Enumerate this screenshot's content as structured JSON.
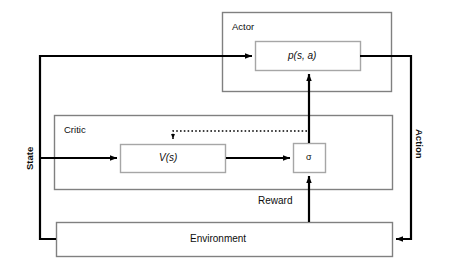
{
  "diagram": {
    "colors": {
      "outer_box_stroke": "#808080",
      "inner_box_stroke": "#a6a6a6",
      "arrow_stroke": "#000000",
      "dotted_stroke": "#000000",
      "background": "#ffffff",
      "text": "#0d0d0d"
    },
    "groups": [
      {
        "id": "actor",
        "label": "Actor"
      },
      {
        "id": "critic",
        "label": "Critic"
      }
    ],
    "nodes": [
      {
        "id": "policy",
        "label": "p(s, a)"
      },
      {
        "id": "value",
        "label": "V(s)"
      },
      {
        "id": "sigma",
        "label": "σ"
      },
      {
        "id": "environment",
        "label": "Environment"
      }
    ],
    "edge_labels": [
      {
        "id": "state",
        "label": "State",
        "orientation": "vertical-up"
      },
      {
        "id": "action",
        "label": "Action",
        "orientation": "vertical-down"
      },
      {
        "id": "reward",
        "label": "Reward",
        "orientation": "horizontal"
      }
    ]
  }
}
